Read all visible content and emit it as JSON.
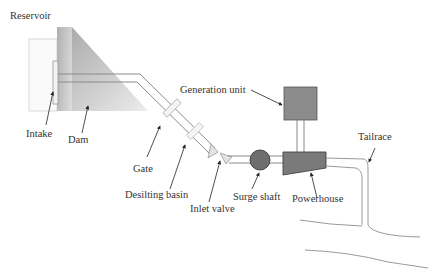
{
  "diagram": {
    "type": "hydropower-plant-schematic",
    "labels": {
      "reservoir": "Reservoir",
      "intake": "Intake",
      "dam": "Dam",
      "gate": "Gate",
      "desilting_basin": "Desilting basin",
      "inlet_valve": "Inlet valve",
      "surge_shaft": "Surge shaft",
      "powerhouse": "Powerhouse",
      "generation_unit": "Generation unit",
      "tailrace": "Tailrace"
    },
    "colors": {
      "dam_gradient_dark": "#9a9a9a",
      "dam_gradient_light": "#e6e6e6",
      "surge_shaft_fill": "#6e6e6e",
      "powerhouse_fill": "#7a7a7a",
      "generation_unit_fill": "#8a8a8a",
      "pipe_stroke": "#888888",
      "text": "#333333"
    }
  }
}
